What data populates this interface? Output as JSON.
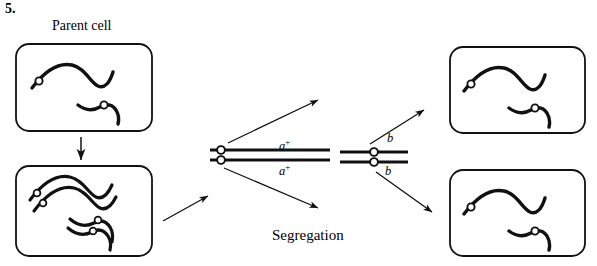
{
  "figure": {
    "question_number": "5.",
    "parent_label": "Parent cell",
    "segregation_label": "Segregation",
    "type": "biology-diagram",
    "topic": "chromosome-segregation",
    "ink_color": "#111111",
    "background_color": "#ffffff"
  },
  "alleles": {
    "a_plus": "a",
    "a_plus_sup": "+",
    "b": "b"
  },
  "cells": {
    "parent": {
      "name": "parent-cell",
      "labels": [
        "a+",
        "b"
      ]
    },
    "replicated": {
      "name": "replicated-cell",
      "labels": [
        "a+",
        "a+",
        "b",
        "b"
      ]
    },
    "daughter_top": {
      "name": "daughter-cell-top",
      "labels": [
        "a+",
        "b"
      ]
    },
    "daughter_bottom": {
      "name": "daughter-cell-bottom",
      "labels": [
        "a+",
        "b"
      ]
    }
  },
  "metaphase": {
    "pair_a": {
      "name": "chromosome-pair-a",
      "top_label": "a+",
      "bottom_label": "a+"
    },
    "pair_b": {
      "name": "chromosome-pair-b",
      "top_label": "b",
      "bottom_label": "b"
    }
  }
}
